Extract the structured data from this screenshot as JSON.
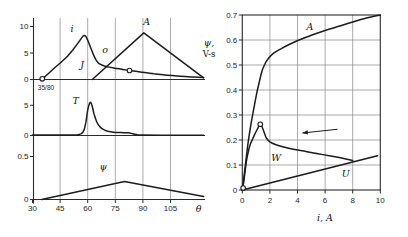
{
  "figure": {
    "bg": "#ffffff",
    "ink": "#1c1c1c",
    "grid_color": "#8f8f8f",
    "axis_color": "#2a2a2a"
  },
  "left_panel": {
    "xlabel": "θ",
    "annotation": "35/80",
    "x_ticks": [
      30,
      45,
      60,
      75,
      90,
      105
    ],
    "grid_x": [
      45,
      60,
      75,
      90,
      105
    ]
  },
  "right_panel": {
    "ylabel_line1": "ψ,",
    "ylabel_line2": "V-s",
    "xlabel": "i, A"
  },
  "chart_data": [
    {
      "id": "left-top",
      "type": "line",
      "xlabel": "θ",
      "xlim": [
        30,
        123
      ],
      "ylim": [
        0,
        11.5
      ],
      "y_ticks": [
        0,
        5,
        10
      ],
      "grid": "vertical",
      "series": [
        {
          "name": "i",
          "smooth": true,
          "width": 1.5,
          "points": [
            [
              35,
              0.1
            ],
            [
              37,
              0.6
            ],
            [
              40,
              1.55
            ],
            [
              43,
              2.5
            ],
            [
              46,
              3.4
            ],
            [
              49,
              4.4
            ],
            [
              52,
              5.6
            ],
            [
              55,
              7.0
            ],
            [
              57,
              8.0
            ],
            [
              58,
              8.3
            ],
            [
              59,
              8.1
            ],
            [
              60,
              7.4
            ],
            [
              61.5,
              6.1
            ],
            [
              63,
              4.8
            ],
            [
              64.5,
              3.7
            ],
            [
              66,
              3.05
            ],
            [
              68,
              2.7
            ],
            [
              70,
              2.45
            ],
            [
              73,
              2.25
            ],
            [
              76,
              2.05
            ],
            [
              79,
              1.9
            ],
            [
              83,
              1.7
            ],
            [
              87,
              1.5
            ],
            [
              91,
              1.3
            ],
            [
              96,
              1.1
            ],
            [
              101,
              0.9
            ],
            [
              107,
              0.72
            ],
            [
              113,
              0.56
            ],
            [
              118,
              0.45
            ],
            [
              123,
              0.35
            ]
          ]
        },
        {
          "name": "A",
          "smooth": false,
          "width": 1.5,
          "points": [
            [
              62.5,
              0
            ],
            [
              90.5,
              8.8
            ],
            [
              123,
              0.3
            ]
          ]
        }
      ],
      "markers": [
        [
          35.3,
          0.12
        ],
        [
          82.7,
          1.7
        ]
      ],
      "text_labels": [
        {
          "text": "i",
          "at": [
            51.5,
            9.0
          ]
        },
        {
          "text": "o",
          "at": [
            69.5,
            5.0
          ]
        },
        {
          "text": "J",
          "at": [
            57,
            2.1
          ]
        },
        {
          "text": "A",
          "at": [
            92,
            10.3
          ]
        }
      ]
    },
    {
      "id": "left-middle",
      "type": "line",
      "xlim": [
        30,
        123
      ],
      "ylim": [
        0,
        5.9
      ],
      "y_ticks": [
        0,
        5
      ],
      "grid": "vertical",
      "series": [
        {
          "name": "T",
          "smooth": true,
          "width": 1.5,
          "points": [
            [
              30,
              0.07
            ],
            [
              50,
              0.07
            ],
            [
              54,
              0.1
            ],
            [
              56.5,
              0.3
            ],
            [
              58,
              0.9
            ],
            [
              59,
              2.2
            ],
            [
              60,
              4.2
            ],
            [
              61,
              5.3
            ],
            [
              61.7,
              5.45
            ],
            [
              62.5,
              4.8
            ],
            [
              63.5,
              3.5
            ],
            [
              65,
              2.2
            ],
            [
              66.5,
              1.5
            ],
            [
              68.5,
              1.0
            ],
            [
              71,
              0.7
            ],
            [
              74,
              0.55
            ],
            [
              78,
              0.48
            ],
            [
              82,
              0.45
            ],
            [
              84.5,
              0.3
            ],
            [
              87,
              0.12
            ],
            [
              90,
              0.06
            ],
            [
              100,
              0.05
            ],
            [
              123,
              0.05
            ]
          ]
        }
      ],
      "markers": [],
      "text_labels": [
        {
          "text": "T",
          "at": [
            53.5,
            5.2
          ]
        }
      ]
    },
    {
      "id": "left-bottom",
      "type": "line",
      "xlim": [
        30,
        123
      ],
      "ylim": [
        0,
        0.55
      ],
      "y_ticks": [
        0,
        0.5
      ],
      "grid": "vertical",
      "series": [
        {
          "name": "psi",
          "smooth": false,
          "width": 1.5,
          "points": [
            [
              35,
              0
            ],
            [
              80,
              0.21
            ],
            [
              123,
              0.035
            ]
          ]
        }
      ],
      "markers": [],
      "text_labels": [
        {
          "text": "ψ",
          "at": [
            68.5,
            0.34
          ]
        }
      ]
    },
    {
      "id": "right",
      "type": "line",
      "xlabel": "i, A",
      "ylabel": "ψ, V-s",
      "xlim": [
        0,
        10
      ],
      "ylim": [
        0,
        0.7
      ],
      "x_ticks": [
        0,
        2,
        4,
        6,
        8,
        10
      ],
      "y_ticks": [
        0,
        0.1,
        0.2,
        0.3,
        0.4,
        0.5,
        0.6,
        0.7
      ],
      "grid": "full",
      "series": [
        {
          "name": "U",
          "smooth": false,
          "width": 1.7,
          "points": [
            [
              0,
              0
            ],
            [
              9.8,
              0.137
            ]
          ]
        },
        {
          "name": "W",
          "smooth": true,
          "width": 1.5,
          "points": [
            [
              0,
              0.005
            ],
            [
              0.1,
              0.03
            ],
            [
              0.2,
              0.075
            ],
            [
              0.3,
              0.115
            ],
            [
              0.42,
              0.15
            ],
            [
              0.55,
              0.178
            ],
            [
              0.75,
              0.205
            ],
            [
              0.95,
              0.228
            ],
            [
              1.15,
              0.25
            ],
            [
              1.3,
              0.263
            ],
            [
              1.45,
              0.25
            ],
            [
              1.6,
              0.228
            ],
            [
              1.75,
              0.208
            ],
            [
              2.0,
              0.193
            ],
            [
              2.4,
              0.182
            ],
            [
              3.0,
              0.172
            ],
            [
              3.8,
              0.162
            ],
            [
              4.6,
              0.154
            ],
            [
              5.5,
              0.145
            ],
            [
              6.4,
              0.136
            ],
            [
              7.2,
              0.128
            ],
            [
              8.0,
              0.118
            ]
          ]
        },
        {
          "name": "A",
          "smooth": true,
          "width": 1.5,
          "points": [
            [
              0,
              0
            ],
            [
              0.2,
              0.09
            ],
            [
              0.4,
              0.18
            ],
            [
              0.6,
              0.255
            ],
            [
              0.8,
              0.315
            ],
            [
              1.0,
              0.375
            ],
            [
              1.2,
              0.425
            ],
            [
              1.4,
              0.47
            ],
            [
              1.6,
              0.5
            ],
            [
              1.9,
              0.527
            ],
            [
              2.3,
              0.549
            ],
            [
              2.8,
              0.565
            ],
            [
              3.4,
              0.582
            ],
            [
              4.2,
              0.602
            ],
            [
              5.0,
              0.619
            ],
            [
              6.0,
              0.638
            ],
            [
              7.0,
              0.655
            ],
            [
              8.0,
              0.672
            ],
            [
              9.0,
              0.688
            ],
            [
              10,
              0.7
            ]
          ]
        }
      ],
      "markers": [
        [
          0.06,
          0.008
        ],
        [
          1.3,
          0.263
        ]
      ],
      "arrow": {
        "from": [
          6.9,
          0.243
        ],
        "to": [
          4.35,
          0.228
        ]
      },
      "text_labels": [
        {
          "text": "A",
          "at": [
            4.9,
            0.642
          ]
        },
        {
          "text": "W",
          "at": [
            2.45,
            0.118
          ]
        },
        {
          "text": "U",
          "at": [
            7.5,
            0.052
          ]
        }
      ]
    }
  ]
}
